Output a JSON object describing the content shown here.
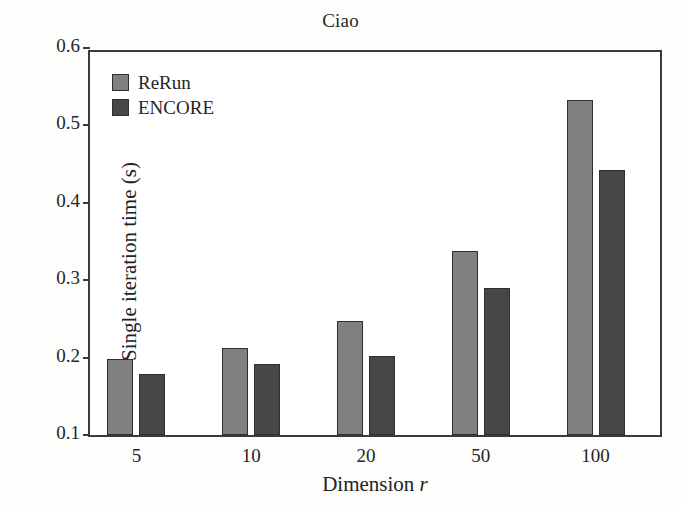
{
  "chart_data": {
    "type": "bar",
    "title": "Ciao",
    "xlabel": "Dimension r",
    "xlabel_plain": "Dimension",
    "xlabel_variable": "r",
    "ylabel": "Single iteration time (s)",
    "categories": [
      "5",
      "10",
      "20",
      "50",
      "100"
    ],
    "series": [
      {
        "name": "ReRun",
        "color": "#808080",
        "values": [
          0.198,
          0.212,
          0.247,
          0.338,
          0.533
        ]
      },
      {
        "name": "ENCORE",
        "color": "#474747",
        "values": [
          0.179,
          0.192,
          0.202,
          0.29,
          0.442
        ]
      }
    ],
    "ylim": [
      0.1,
      0.6
    ],
    "yticks": [
      "0.1",
      "0.2",
      "0.3",
      "0.4",
      "0.5",
      "0.6"
    ],
    "ytick_values": [
      0.1,
      0.2,
      0.3,
      0.4,
      0.5,
      0.6
    ],
    "grid": false,
    "legend_position": "top-left",
    "bar_edge_color": "#2f2f2f",
    "axis_color": "#3a3a3a",
    "background_color": "#ffffff"
  }
}
